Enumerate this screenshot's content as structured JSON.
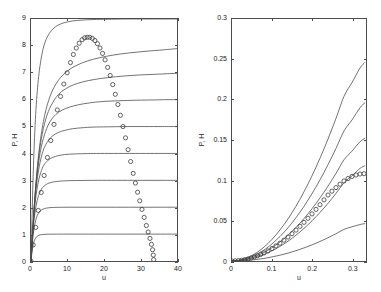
{
  "figure": {
    "background": "#ffffff",
    "line_color": "#4d4d4d",
    "marker_color": "#3a3a3a",
    "caption": ""
  },
  "chart_data": [
    {
      "type": "line",
      "panel": "left",
      "title": "",
      "xlabel": "u",
      "ylabel": "P, H",
      "xlim": [
        0,
        40
      ],
      "ylim": [
        0,
        9
      ],
      "xticks": [
        0,
        10,
        20,
        30,
        40
      ],
      "xticklabels": [
        "0",
        "10",
        "20",
        "30",
        "40"
      ],
      "yticks": [
        0,
        1,
        2,
        3,
        4,
        5,
        6,
        7,
        8,
        9
      ],
      "yticklabels": [
        "0",
        "1",
        "2",
        "3",
        "4",
        "5",
        "6",
        "7",
        "8",
        "9"
      ],
      "grid": false,
      "legend": "none",
      "series": [
        {
          "name": "H plateau 1",
          "style": "solid",
          "plateau": 1,
          "rise_rate": 1.55,
          "x": [
            0,
            0.4,
            0.8,
            1.2,
            1.7,
            2.2,
            2.8,
            3.5,
            4.4,
            5.5,
            7,
            9,
            12,
            16,
            22,
            30,
            40
          ],
          "y": [
            0,
            0.46,
            0.71,
            0.84,
            0.92,
            0.96,
            0.98,
            0.99,
            0.995,
            0.998,
            0.999,
            1.0,
            1.0,
            1.0,
            1.0,
            1.0,
            1.0
          ]
        },
        {
          "name": "H plateau 2",
          "style": "solid",
          "plateau": 2,
          "rise_rate": 1.1,
          "x": [
            0,
            0.5,
            1.0,
            1.6,
            2.2,
            2.9,
            3.7,
            4.6,
            5.8,
            7.2,
            9,
            11.5,
            15,
            20,
            27,
            34,
            40
          ],
          "y": [
            0,
            0.85,
            1.33,
            1.65,
            1.81,
            1.9,
            1.95,
            1.975,
            1.99,
            1.995,
            1.998,
            2.0,
            2.0,
            2.0,
            2.0,
            2.0,
            2.0
          ]
        },
        {
          "name": "H plateau 3",
          "style": "solid",
          "plateau": 3,
          "rise_rate": 0.88,
          "x": [
            0,
            0.6,
            1.2,
            1.9,
            2.7,
            3.6,
            4.6,
            5.8,
            7.2,
            9,
            11.2,
            14,
            17.5,
            22,
            28,
            34,
            40
          ],
          "y": [
            0,
            1.18,
            1.9,
            2.35,
            2.63,
            2.79,
            2.88,
            2.93,
            2.96,
            2.98,
            2.99,
            2.995,
            3.0,
            3.0,
            3.0,
            3.0,
            3.0
          ]
        },
        {
          "name": "H plateau 4",
          "style": "solid",
          "plateau": 4,
          "rise_rate": 0.74,
          "x": [
            0,
            0.7,
            1.4,
            2.2,
            3.1,
            4.1,
            5.3,
            6.7,
            8.3,
            10.2,
            12.5,
            15.5,
            19,
            24,
            30,
            35,
            40
          ],
          "y": [
            0,
            1.5,
            2.45,
            3.06,
            3.45,
            3.67,
            3.81,
            3.89,
            3.94,
            3.97,
            3.985,
            3.995,
            4.0,
            4.0,
            4.0,
            4.0,
            4.0
          ]
        },
        {
          "name": "H plateau 5",
          "style": "solid",
          "plateau": 5,
          "rise_rate": 0.64,
          "x": [
            0,
            0.8,
            1.6,
            2.5,
            3.5,
            4.7,
            6.0,
            7.5,
            9.3,
            11.4,
            14,
            17,
            21,
            26,
            31,
            36,
            40
          ],
          "y": [
            0,
            1.78,
            2.93,
            3.68,
            4.17,
            4.47,
            4.66,
            4.78,
            4.86,
            4.92,
            4.955,
            4.98,
            4.99,
            5.0,
            5.0,
            5.0,
            5.0
          ]
        },
        {
          "name": "H plateau 6",
          "style": "solid",
          "plateau": 6,
          "rise_rate": 0.56,
          "x": [
            0,
            0.9,
            1.8,
            2.8,
            4.0,
            5.3,
            6.8,
            8.5,
            10.5,
            13,
            16,
            19.5,
            24,
            29,
            34,
            37,
            40
          ],
          "y": [
            0,
            2.02,
            3.35,
            4.23,
            4.82,
            5.2,
            5.45,
            5.61,
            5.72,
            5.81,
            5.88,
            5.93,
            5.96,
            5.98,
            5.99,
            6.0,
            6.0
          ]
        },
        {
          "name": "H plateau 7",
          "style": "solid",
          "plateau": 7,
          "rise_rate": 0.5,
          "x": [
            0,
            1.0,
            2.0,
            3.1,
            4.4,
            5.9,
            7.5,
            9.4,
            11.6,
            14.2,
            17.3,
            21,
            25.5,
            30,
            35,
            38,
            40
          ],
          "y": [
            0,
            2.24,
            3.74,
            4.74,
            5.43,
            5.88,
            6.19,
            6.4,
            6.55,
            6.66,
            6.75,
            6.82,
            6.88,
            6.92,
            6.95,
            6.97,
            6.98
          ]
        },
        {
          "name": "H plateau 8",
          "style": "solid",
          "plateau": 8,
          "rise_rate": 0.45,
          "x": [
            0,
            1.1,
            2.2,
            3.4,
            4.8,
            6.4,
            8.2,
            10.3,
            12.7,
            15.5,
            18.8,
            22.6,
            27,
            31.5,
            36,
            38.5,
            40
          ],
          "y": [
            0,
            2.44,
            4.08,
            5.19,
            5.96,
            6.48,
            6.84,
            7.1,
            7.29,
            7.44,
            7.56,
            7.66,
            7.74,
            7.8,
            7.85,
            7.88,
            7.9
          ]
        },
        {
          "name": "H plateau 9",
          "style": "solid",
          "plateau": 9,
          "rise_rate": 0.82,
          "x": [
            0,
            0.6,
            1.2,
            1.9,
            2.7,
            3.6,
            4.7,
            6.0,
            7.5,
            9.3,
            11.5,
            14,
            17,
            21,
            26,
            33,
            40
          ],
          "y": [
            0,
            3.22,
            5.25,
            6.6,
            7.46,
            8.03,
            8.39,
            8.63,
            8.78,
            8.87,
            8.93,
            8.96,
            8.98,
            8.99,
            9.0,
            9.0,
            9.0
          ]
        },
        {
          "name": "P markers",
          "style": "circles",
          "marker": "o",
          "peak_x": 16.5,
          "peak_y": 8.32,
          "x_end": 33.6,
          "x": [
            0,
            0.6,
            1.3,
            2.0,
            2.8,
            3.6,
            4.5,
            5.4,
            6.3,
            7.2,
            8.1,
            9.0,
            9.9,
            10.8,
            11.6,
            12.4,
            13.2,
            14.0,
            14.7,
            15.4,
            16.1,
            16.8,
            17.5,
            18.2,
            18.9,
            19.6,
            20.3,
            21.0,
            21.7,
            22.4,
            23.1,
            23.8,
            24.5,
            25.2,
            25.9,
            26.6,
            27.3,
            28.0,
            28.6,
            29.2,
            29.8,
            30.4,
            31.0,
            31.6,
            32.1,
            32.6,
            33.0,
            33.3,
            33.5,
            33.6
          ],
          "y": [
            0,
            0.6,
            1.25,
            1.88,
            2.55,
            3.18,
            3.85,
            4.48,
            5.08,
            5.62,
            6.12,
            6.58,
            7.0,
            7.38,
            7.68,
            7.92,
            8.1,
            8.23,
            8.3,
            8.32,
            8.32,
            8.28,
            8.2,
            8.08,
            7.92,
            7.72,
            7.48,
            7.2,
            6.9,
            6.56,
            6.2,
            5.82,
            5.42,
            5.0,
            4.58,
            4.14,
            3.7,
            3.26,
            2.9,
            2.56,
            2.24,
            1.92,
            1.62,
            1.32,
            1.08,
            0.84,
            0.62,
            0.42,
            0.22,
            0.05
          ]
        }
      ]
    },
    {
      "type": "line",
      "panel": "right",
      "title": "",
      "xlabel": "u",
      "ylabel": "P, H",
      "xlim": [
        0,
        0.335
      ],
      "ylim": [
        0,
        0.3
      ],
      "xticks": [
        0,
        0.1,
        0.2,
        0.3
      ],
      "xticklabels": [
        "0",
        "0.1",
        "0.2",
        "0.3"
      ],
      "yticks": [
        0,
        0.05,
        0.1,
        0.15,
        0.2,
        0.25,
        0.3
      ],
      "yticklabels": [
        "0",
        "0.05",
        "0.1",
        "0.15",
        "0.2",
        "0.25",
        "0.3"
      ],
      "grid": false,
      "legend": "none",
      "series": [
        {
          "name": "H curve 1 (steepest)",
          "style": "solid",
          "end_y": 0.246,
          "x": [
            0,
            0.02,
            0.04,
            0.06,
            0.08,
            0.1,
            0.12,
            0.14,
            0.16,
            0.18,
            0.2,
            0.22,
            0.24,
            0.26,
            0.28,
            0.3,
            0.32,
            0.332
          ],
          "y": [
            0,
            0.0012,
            0.0045,
            0.0098,
            0.0172,
            0.0268,
            0.0385,
            0.0522,
            0.068,
            0.0858,
            0.1056,
            0.1274,
            0.1512,
            0.1768,
            0.2042,
            0.2212,
            0.2392,
            0.246
          ]
        },
        {
          "name": "H curve 2",
          "style": "solid",
          "end_y": 0.196,
          "x": [
            0,
            0.02,
            0.04,
            0.06,
            0.08,
            0.1,
            0.12,
            0.14,
            0.16,
            0.18,
            0.2,
            0.22,
            0.24,
            0.26,
            0.28,
            0.3,
            0.32,
            0.332
          ],
          "y": [
            0,
            0.0009,
            0.0036,
            0.0078,
            0.0136,
            0.0212,
            0.0304,
            0.0412,
            0.0537,
            0.0678,
            0.0834,
            0.1006,
            0.1194,
            0.1396,
            0.1612,
            0.1748,
            0.19,
            0.196
          ]
        },
        {
          "name": "H curve 3",
          "style": "solid",
          "end_y": 0.152,
          "x": [
            0,
            0.02,
            0.04,
            0.06,
            0.08,
            0.1,
            0.12,
            0.14,
            0.16,
            0.18,
            0.2,
            0.22,
            0.24,
            0.26,
            0.28,
            0.3,
            0.32,
            0.332
          ],
          "y": [
            0,
            0.0007,
            0.0028,
            0.0061,
            0.0106,
            0.0165,
            0.0236,
            0.032,
            0.0417,
            0.0526,
            0.0648,
            0.0782,
            0.0928,
            0.1086,
            0.1254,
            0.1362,
            0.1478,
            0.152
          ]
        },
        {
          "name": "H curve 4",
          "style": "solid",
          "end_y": 0.118,
          "x": [
            0,
            0.02,
            0.04,
            0.06,
            0.08,
            0.1,
            0.12,
            0.14,
            0.16,
            0.18,
            0.2,
            0.22,
            0.24,
            0.26,
            0.28,
            0.3,
            0.32,
            0.332
          ],
          "y": [
            0,
            0.0005,
            0.0021,
            0.0046,
            0.0081,
            0.0126,
            0.0181,
            0.0245,
            0.032,
            0.0404,
            0.0498,
            0.0602,
            0.0715,
            0.0838,
            0.097,
            0.1056,
            0.1148,
            0.118
          ]
        },
        {
          "name": "H curve 5 (shallowest)",
          "style": "solid",
          "end_y": 0.046,
          "x": [
            0,
            0.02,
            0.04,
            0.06,
            0.08,
            0.1,
            0.12,
            0.14,
            0.16,
            0.18,
            0.2,
            0.22,
            0.24,
            0.26,
            0.28,
            0.3,
            0.32,
            0.332
          ],
          "y": [
            0,
            0.0002,
            0.0008,
            0.0018,
            0.0032,
            0.005,
            0.0072,
            0.0098,
            0.0128,
            0.0162,
            0.02,
            0.0242,
            0.0288,
            0.0338,
            0.0392,
            0.0424,
            0.0452,
            0.0463
          ]
        },
        {
          "name": "P markers",
          "style": "circles",
          "marker": "o",
          "end_y": 0.108,
          "x": [
            0,
            0.008,
            0.016,
            0.024,
            0.032,
            0.04,
            0.048,
            0.056,
            0.064,
            0.072,
            0.08,
            0.09,
            0.1,
            0.11,
            0.12,
            0.13,
            0.14,
            0.15,
            0.16,
            0.17,
            0.18,
            0.19,
            0.2,
            0.21,
            0.22,
            0.23,
            0.24,
            0.25,
            0.26,
            0.27,
            0.28,
            0.29,
            0.3,
            0.31,
            0.32,
            0.33
          ],
          "y": [
            0,
            0.0002,
            0.0005,
            0.001,
            0.0017,
            0.0026,
            0.0037,
            0.005,
            0.0065,
            0.0082,
            0.01,
            0.0126,
            0.0155,
            0.0187,
            0.0221,
            0.0258,
            0.0297,
            0.0339,
            0.0383,
            0.043,
            0.0479,
            0.053,
            0.0584,
            0.064,
            0.0698,
            0.0758,
            0.0818,
            0.0866,
            0.091,
            0.0952,
            0.0992,
            0.1022,
            0.1048,
            0.1066,
            0.1078,
            0.1082
          ]
        }
      ]
    }
  ]
}
